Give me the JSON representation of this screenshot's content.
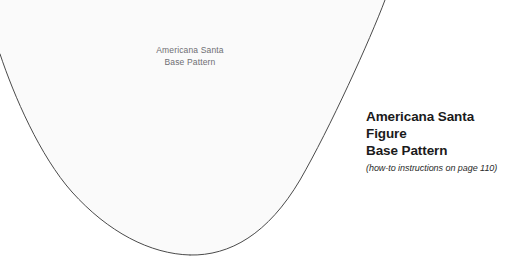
{
  "page": {
    "width": 516,
    "height": 262,
    "background_color": "#ffffff"
  },
  "pattern": {
    "name": "pattern-outline",
    "fill_color": "#fafafa",
    "stroke_color": "#4a4a4a",
    "stroke_width": 1,
    "inner_label": "Americana Santa\nBase Pattern",
    "inner_label_color": "#6e6e73",
    "left_edge_entry_y": 54,
    "top_edge_exit_x": 385,
    "bottom_apex_x": 190,
    "bottom_apex_y": 255
  },
  "caption": {
    "headline": "Americana Santa Figure\nBase Pattern",
    "headline_color": "#1b1b1b",
    "subline": "(how-to instructions on page 110)",
    "subline_color": "#2a2a2a"
  }
}
